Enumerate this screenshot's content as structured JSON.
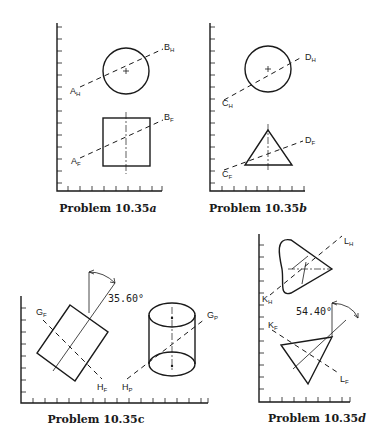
{
  "panels": [
    {
      "id": "a",
      "caption_prefix": "Problem 10.35",
      "caption_suffix": "a",
      "labels": {
        "top_left": "A",
        "top_left_sub": "H",
        "top_right": "B",
        "top_right_sub": "H",
        "bot_left": "A",
        "bot_left_sub": "F",
        "bot_right": "B",
        "bot_right_sub": "F"
      }
    },
    {
      "id": "b",
      "caption_prefix": "Problem 10.35",
      "caption_suffix": "b",
      "labels": {
        "top_left": "C",
        "top_left_sub": "H",
        "top_right": "D",
        "top_right_sub": "H",
        "bot_left": "C",
        "bot_left_sub": "F",
        "bot_right": "D",
        "bot_right_sub": "F"
      }
    },
    {
      "id": "c",
      "caption_prefix": "Problem 10.35",
      "caption_suffix": "c",
      "angle": "35.60°",
      "labels": {
        "gf": "G",
        "gf_sub": "F",
        "hf": "H",
        "hf_sub": "F",
        "gp": "G",
        "gp_sub": "P",
        "hp": "H",
        "hp_sub": "P"
      }
    },
    {
      "id": "d",
      "caption_prefix": "Problem 10.35",
      "caption_suffix": "d",
      "angle": "54.40°",
      "labels": {
        "kh": "K",
        "kh_sub": "H",
        "lh": "L",
        "lh_sub": "H",
        "kf": "K",
        "kf_sub": "F",
        "lf": "L",
        "lf_sub": "F"
      }
    }
  ],
  "colors": {
    "ink": "#1a1a1a",
    "background": "#ffffff"
  }
}
